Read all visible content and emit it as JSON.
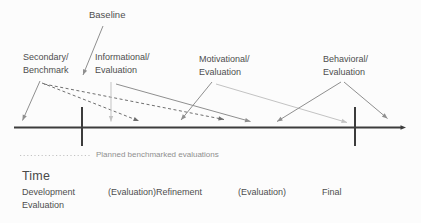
{
  "colors": {
    "axis": "#3c3c3c",
    "arrow_mid": "#8f8f8f",
    "arrow_light": "#c3c3c3",
    "arrow_dashed": "#6e6e6e",
    "legend_dotted": "#c3c3c3"
  },
  "labels": {
    "baseline": "Baseline",
    "phases": {
      "secondary": {
        "line1": "Secondary/",
        "line2": "Benchmark"
      },
      "informational": {
        "line1": "Informational/",
        "line2": "Evaluation"
      },
      "motivational": {
        "line1": "Motivational/",
        "line2": "Evaluation"
      },
      "behavioral": {
        "line1": "Behavioral/",
        "line2": "Evaluation"
      }
    },
    "legend": "Planned benchmarked evaluations",
    "time": "Time",
    "stages": {
      "development": {
        "line1": "Development",
        "line2": "Evaluation"
      },
      "refinement": "(Evaluation)Refinement",
      "evaluation": "(Evaluation)",
      "final": "Final"
    }
  },
  "diagram": {
    "axis": {
      "x1": 14,
      "x2": 398,
      "y": 127.5,
      "tip_x": 406
    },
    "ticks": [
      {
        "x": 82,
        "y1": 107,
        "y2": 146
      },
      {
        "x": 355,
        "y1": 107,
        "y2": 146
      }
    ],
    "arrows": [
      {
        "name": "baseline-pointer",
        "x1": 103,
        "y1": 26,
        "x2": 83,
        "y2": 75,
        "color": "arrow_mid"
      },
      {
        "name": "secondary-pointer",
        "x1": 40,
        "y1": 81,
        "x2": 22.5,
        "y2": 120.5,
        "color": "arrow_mid"
      },
      {
        "name": "planned-dashed-arrow-1",
        "x1": 42,
        "y1": 83,
        "x2": 139,
        "y2": 121,
        "color": "arrow_dashed",
        "dash": "3,2.5"
      },
      {
        "name": "planned-dashed-arrow-2",
        "x1": 44,
        "y1": 84,
        "x2": 224,
        "y2": 119.5,
        "color": "arrow_dashed",
        "dash": "3,2.5"
      },
      {
        "name": "informational-vertical-pointer",
        "x1": 111,
        "y1": 82,
        "x2": 111,
        "y2": 121.5,
        "color": "arrow_light"
      },
      {
        "name": "informational-diagonal-pointer",
        "x1": 116,
        "y1": 84,
        "x2": 250.5,
        "y2": 121.5,
        "color": "arrow_mid"
      },
      {
        "name": "motivational-left-pointer",
        "x1": 212,
        "y1": 82,
        "x2": 181,
        "y2": 120,
        "color": "arrow_mid"
      },
      {
        "name": "motivational-right-pointer",
        "x1": 216,
        "y1": 84,
        "x2": 347,
        "y2": 122.5,
        "color": "arrow_light"
      },
      {
        "name": "behavioral-left-pointer",
        "x1": 341,
        "y1": 82,
        "x2": 277,
        "y2": 121.5,
        "color": "arrow_mid"
      },
      {
        "name": "behavioral-right-pointer",
        "x1": 344,
        "y1": 82,
        "x2": 387.5,
        "y2": 118.5,
        "color": "arrow_mid"
      }
    ],
    "legend_line": {
      "x1": 20,
      "x2": 90,
      "y": 155.5
    }
  }
}
